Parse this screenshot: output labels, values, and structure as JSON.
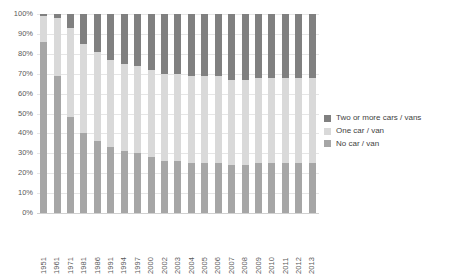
{
  "chart_data": {
    "type": "bar",
    "subtype": "stacked-percentage-column",
    "title": "",
    "subtitle": "",
    "xlabel": "",
    "ylabel": "",
    "ylim": [
      0,
      100
    ],
    "grid": true,
    "legend_position": "right",
    "categories": [
      "1951",
      "1961",
      "1971",
      "1981",
      "1986",
      "1991",
      "1994",
      "1997",
      "2000",
      "2002",
      "2003",
      "2004",
      "2005",
      "2006",
      "2007",
      "2008",
      "2009",
      "2010",
      "2011",
      "2012",
      "2013"
    ],
    "y_ticks": [
      "0%",
      "10%",
      "20%",
      "30%",
      "40%",
      "50%",
      "60%",
      "70%",
      "80%",
      "90%",
      "100%"
    ],
    "y_tick_values": [
      0,
      10,
      20,
      30,
      40,
      50,
      60,
      70,
      80,
      90,
      100
    ],
    "series": [
      {
        "name": "No car / van",
        "color": "#a6a6a6",
        "values": [
          86,
          69,
          48,
          40,
          36,
          33,
          31,
          30,
          28,
          26,
          26,
          25,
          25,
          25,
          24,
          24,
          25,
          25,
          25,
          25,
          25
        ]
      },
      {
        "name": "One car / van",
        "color": "#d9d9d9",
        "values": [
          13,
          29,
          45,
          45,
          45,
          44,
          44,
          44,
          44,
          44,
          44,
          44,
          44,
          44,
          43,
          43,
          43,
          43,
          43,
          43,
          43
        ]
      },
      {
        "name": "Two or more cars / vans",
        "color": "#808080",
        "values": [
          1,
          2,
          7,
          15,
          19,
          23,
          25,
          26,
          28,
          30,
          30,
          31,
          31,
          31,
          33,
          33,
          32,
          32,
          32,
          32,
          32
        ]
      }
    ]
  },
  "legend": {
    "items": [
      {
        "label": "Two or more cars / vans",
        "color": "#808080"
      },
      {
        "label": "One car / van",
        "color": "#d9d9d9"
      },
      {
        "label": "No car / van",
        "color": "#a6a6a6"
      }
    ]
  }
}
